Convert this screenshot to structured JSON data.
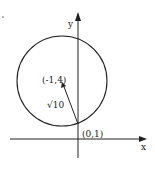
{
  "diagram": {
    "type": "coordinate-plane-circle",
    "axes": {
      "x_label": "x",
      "y_label": "y"
    },
    "circle": {
      "center_label": "(-1,4)",
      "radius_label": "√10"
    },
    "point": {
      "label": "(0,1)"
    },
    "colors": {
      "ink": "#222222",
      "background": "#ffffff"
    }
  }
}
